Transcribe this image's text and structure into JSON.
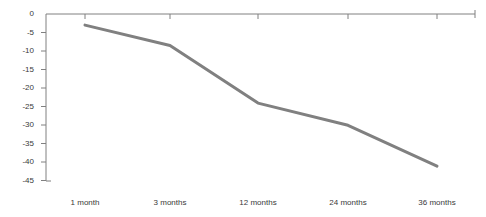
{
  "chart_data": {
    "type": "line",
    "title": "",
    "subtitle": "",
    "xlabel": "",
    "ylabel": "",
    "categories": [
      "1 month",
      "3 months",
      "12 months",
      "24 months",
      "36 months"
    ],
    "values": [
      -3,
      -8.5,
      -24,
      -30,
      -41
    ],
    "series": [
      {
        "name": "",
        "values": [
          -3,
          -8.5,
          -24,
          -30,
          -41
        ]
      }
    ],
    "ylim": [
      -45,
      0
    ],
    "yticks": [
      0,
      -5,
      -10,
      -15,
      -20,
      -25,
      -30,
      -35,
      -40,
      -45
    ],
    "ytick_labels": [
      "0",
      "-5",
      "-10",
      "-15",
      "-20",
      "-25",
      "-30",
      "-35",
      "-40",
      "-45"
    ],
    "grid": false,
    "legend": "none",
    "line_color": "#808080",
    "axis_color": "#808080",
    "text_color": "#3a3a3a"
  }
}
